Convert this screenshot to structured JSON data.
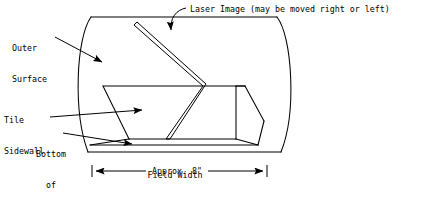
{
  "diagram": {
    "stroke_color": "#000000",
    "background_color": "#ffffff",
    "labels": {
      "laser_image": "Laser Image (may be moved right or left)",
      "outer_surface_line1": "Outer",
      "outer_surface_line2": "Surface",
      "tile_sidewall_line1": "Tile",
      "tile_sidewall_line2": "Sidewall",
      "bottom_of_cavity_line1": "Bottom",
      "bottom_of_cavity_line2": "of",
      "bottom_of_cavity_line3": "Cavity",
      "dimension_value": "Approx. 8\"",
      "dimension_caption": "Field Width"
    },
    "callouts": [
      {
        "name": "laser-image",
        "text": "Laser Image (may be moved right or left)",
        "pointer": "curved-arrow-down"
      },
      {
        "name": "outer-surface",
        "text": "Outer Surface",
        "pointer": "straight-arrow-down-right"
      },
      {
        "name": "tile-sidewall",
        "text": "Tile Sidewall",
        "pointer": "straight-arrow-right"
      },
      {
        "name": "bottom-of-cavity",
        "text": "Bottom of Cavity",
        "pointer": "straight-arrow-right"
      }
    ],
    "dimension": {
      "value": "Approx. 8\"",
      "caption": "Field Width",
      "style": "double-headed-arrow-with-end-ticks"
    }
  }
}
